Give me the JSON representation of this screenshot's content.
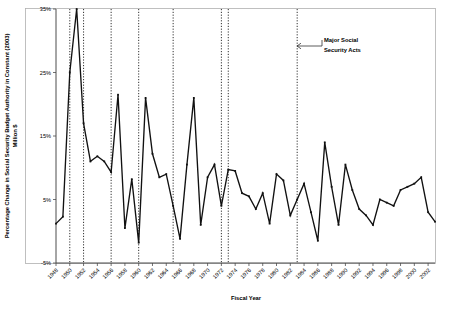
{
  "chart_data": {
    "type": "line",
    "title": "",
    "xlabel": "Fiscal Year",
    "ylabel": "Percentage Change in Social Security Budget Authority in Constant (2003) Million $",
    "ylabel_line1": "Percentage Change in Social Security Budget Authority in Constant (2003)",
    "ylabel_line2": "Million $",
    "ylim": [
      -5,
      35
    ],
    "xlim": [
      1948,
      2003
    ],
    "grid": false,
    "legend": "none",
    "ytick_labels": [
      "35%",
      "25%",
      "15%",
      "5%",
      "-5%"
    ],
    "ytick_values": [
      35,
      25,
      15,
      5,
      -5
    ],
    "xtick_labels": [
      "1948",
      "1950",
      "1952",
      "1954",
      "1956",
      "1958",
      "1960",
      "1962",
      "1964",
      "1966",
      "1968",
      "1970",
      "1972",
      "1974",
      "1976",
      "1978",
      "1980",
      "1982",
      "1984",
      "1986",
      "1988",
      "1990",
      "1992",
      "1994",
      "1996",
      "1998",
      "2000",
      "2002"
    ],
    "xtick_values": [
      1948,
      1950,
      1952,
      1954,
      1956,
      1958,
      1960,
      1962,
      1964,
      1966,
      1968,
      1970,
      1972,
      1974,
      1976,
      1978,
      1980,
      1982,
      1984,
      1986,
      1988,
      1990,
      1992,
      1994,
      1996,
      1998,
      2000,
      2002
    ],
    "series": [
      {
        "name": "Percentage Change in Social Security Budget Authority",
        "color": "#111111",
        "x": [
          1948,
          1949,
          1950,
          1951,
          1952,
          1953,
          1954,
          1955,
          1956,
          1957,
          1958,
          1959,
          1960,
          1961,
          1962,
          1963,
          1964,
          1965,
          1966,
          1967,
          1968,
          1969,
          1970,
          1971,
          1972,
          1973,
          1974,
          1975,
          1976,
          1977,
          1978,
          1979,
          1980,
          1981,
          1982,
          1983,
          1984,
          1985,
          1986,
          1987,
          1988,
          1989,
          1990,
          1991,
          1992,
          1993,
          1994,
          1995,
          1996,
          1997,
          1998,
          1999,
          2000,
          2001,
          2002,
          2003
        ],
        "values": [
          1.2,
          2.3,
          25.0,
          35.0,
          17.0,
          11.0,
          11.8,
          11.0,
          9.3,
          21.5,
          0.5,
          8.2,
          -1.8,
          21.0,
          12.2,
          8.5,
          9.0,
          4.0,
          -1.2,
          10.5,
          21.0,
          1.0,
          8.5,
          10.5,
          4.0,
          9.7,
          9.5,
          6.0,
          5.5,
          3.5,
          6.0,
          1.2,
          9.0,
          8.0,
          2.5,
          5.0,
          7.5,
          3.0,
          -1.5,
          14.0,
          7.0,
          1.0,
          10.5,
          6.5,
          3.5,
          2.5,
          1.0,
          5.0,
          4.5,
          4.0,
          6.5,
          7.0,
          7.5,
          8.5,
          3.0,
          1.5
        ]
      }
    ],
    "event_lines": {
      "label": "Major Social Security Acts",
      "years": [
        1950,
        1952,
        1956,
        1960,
        1965,
        1972,
        1973,
        1983
      ]
    },
    "annotation": {
      "line1": "Major Social",
      "line2": "Security Acts",
      "arrow": "left-arrow"
    }
  }
}
